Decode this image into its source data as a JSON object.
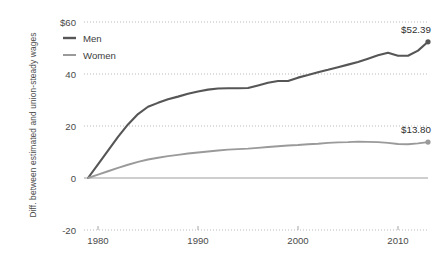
{
  "chart_data": {
    "type": "line",
    "title": "",
    "subtitle": "",
    "xlabel": "",
    "ylabel": "Diff. between estimated and union-steady wages",
    "xlim": [
      1979,
      2013
    ],
    "ylim": [
      -20,
      60
    ],
    "grid": "horizontal-dotted",
    "zero_line": true,
    "legend_position": "top-left",
    "x_ticks": [
      "1980",
      "1990",
      "2000",
      "2010"
    ],
    "x_tick_values": [
      1980,
      1990,
      2000,
      2010
    ],
    "y_ticks": [
      "$60",
      "40",
      "20",
      "0",
      "-20"
    ],
    "y_tick_values": [
      60,
      40,
      20,
      0,
      -20
    ],
    "x": [
      1979,
      1980,
      1981,
      1982,
      1983,
      1984,
      1985,
      1986,
      1987,
      1988,
      1989,
      1990,
      1991,
      1992,
      1993,
      1994,
      1995,
      1996,
      1997,
      1998,
      1999,
      2000,
      2001,
      2002,
      2003,
      2004,
      2005,
      2006,
      2007,
      2008,
      2009,
      2010,
      2011,
      2012,
      2013
    ],
    "series": [
      {
        "name": "Men",
        "color": "#565656",
        "end_label": "$52.39",
        "end_value": 52.39,
        "values": [
          0,
          5.2,
          10.5,
          15.8,
          20.6,
          24.6,
          27.4,
          28.9,
          30.3,
          31.3,
          32.4,
          33.3,
          34.0,
          34.4,
          34.5,
          34.5,
          34.6,
          35.6,
          36.6,
          37.3,
          37.3,
          38.6,
          39.6,
          40.7,
          41.6,
          42.6,
          43.6,
          44.6,
          45.9,
          47.2,
          48.2,
          47.0,
          47.0,
          49.0,
          52.39
        ]
      },
      {
        "name": "Women",
        "color": "#9a9a9a",
        "end_label": "$13.80",
        "end_value": 13.8,
        "values": [
          0,
          1.3,
          2.6,
          3.9,
          5.1,
          6.2,
          7.1,
          7.8,
          8.4,
          8.9,
          9.4,
          9.8,
          10.2,
          10.6,
          10.9,
          11.1,
          11.3,
          11.6,
          11.9,
          12.2,
          12.5,
          12.7,
          13.0,
          13.2,
          13.5,
          13.7,
          13.8,
          14.0,
          13.9,
          13.8,
          13.5,
          13.1,
          13.0,
          13.3,
          13.8
        ]
      }
    ]
  },
  "legend": {
    "items": [
      {
        "label": "Men",
        "color": "#565656"
      },
      {
        "label": "Women",
        "color": "#9a9a9a"
      }
    ]
  },
  "axis": {
    "y_label": "Diff. between estimated and union-steady wages"
  }
}
